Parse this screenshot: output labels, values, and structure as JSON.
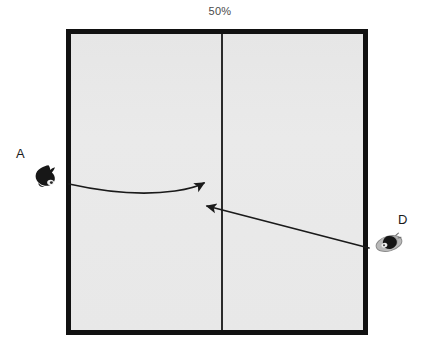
{
  "scene": {
    "caption": "50%",
    "arena": {
      "name": "enclosure",
      "border_color": "#111111",
      "fill_color": "#e8e8e8",
      "divider_color": "#2b2b2b"
    },
    "markers": [
      {
        "id": "a",
        "label": "A",
        "icon": "cat-silhouette-icon",
        "icon_color": "#1a1a1a",
        "position": "outside-left"
      },
      {
        "id": "d",
        "label": "D",
        "icon": "beetle-silhouette-icon",
        "icon_color": "#6e6e6e",
        "position": "outside-right"
      }
    ],
    "arrows": [
      {
        "id": "arrow-a",
        "from": "A",
        "to": "divider",
        "style": "curved",
        "color": "#1a1a1a"
      },
      {
        "id": "arrow-d",
        "from": "D",
        "to": "divider",
        "style": "straight",
        "color": "#1a1a1a"
      }
    ]
  }
}
